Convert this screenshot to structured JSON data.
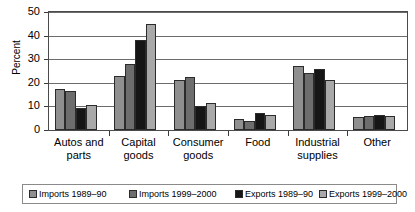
{
  "chart": {
    "type": "bar",
    "title": "",
    "ylabel": "Percent"
  },
  "chart_data": {
    "type": "bar",
    "title": "",
    "subtitle": "",
    "xlabel": "",
    "ylabel": "Percent",
    "ylim": [
      0,
      50
    ],
    "yticks": [
      0,
      10,
      20,
      30,
      40,
      50
    ],
    "grid": true,
    "legend_position": "bottom",
    "categories": [
      "Autos and parts",
      "Capital goods",
      "Consumer goods",
      "Food",
      "Industrial supplies",
      "Other"
    ],
    "series": [
      {
        "name": "Imports 1989–90",
        "color": "#8f8f8f",
        "values": [
          17.5,
          23,
          21,
          4.5,
          27,
          5.5
        ]
      },
      {
        "name": "Imports 1999–2000",
        "color": "#6d6d6d",
        "values": [
          16.5,
          28,
          22.5,
          4,
          24,
          6
        ]
      },
      {
        "name": "Exports 1989–90",
        "color": "#161616",
        "values": [
          9.5,
          38,
          10,
          7,
          26,
          6.5
        ]
      },
      {
        "name": "Exports 1999–2000",
        "color": "#a9a9a9",
        "values": [
          10.5,
          45,
          11.5,
          6.5,
          21,
          6
        ]
      }
    ]
  },
  "axis": {
    "yticks": [
      "50",
      "40",
      "30",
      "20",
      "10",
      "0"
    ],
    "ylabel": "Percent"
  },
  "xlabels": [
    {
      "line1": "Autos and",
      "line2": "parts"
    },
    {
      "line1": "Capital",
      "line2": "goods"
    },
    {
      "line1": "Consumer",
      "line2": "goods"
    },
    {
      "line1": "Food",
      "line2": ""
    },
    {
      "line1": "Industrial",
      "line2": "supplies"
    },
    {
      "line1": "Other",
      "line2": ""
    }
  ],
  "legend": {
    "items": [
      {
        "label": "Imports 1989–90",
        "swatch": "#8f8f8f"
      },
      {
        "label": "Imports 1999–2000",
        "swatch": "#6d6d6d"
      },
      {
        "label": "Exports 1989–90",
        "swatch": "#161616"
      },
      {
        "label": "Exports 1999–2000",
        "swatch": "#a9a9a9"
      }
    ]
  }
}
